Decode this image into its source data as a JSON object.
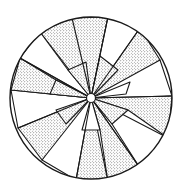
{
  "figure": {
    "center": [
      91,
      98
    ],
    "radius": 81,
    "facet_count": 16,
    "stroke_color": "#1a1a1a",
    "background_color": "#ffffff",
    "stipple_color": "#2a2a2a"
  }
}
